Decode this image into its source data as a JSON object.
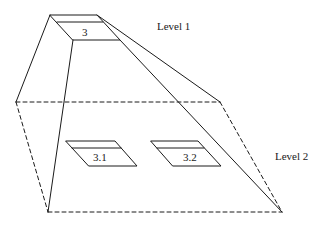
{
  "diagram": {
    "title": "",
    "colors": {
      "stroke": "#1a1a1a",
      "background": "#ffffff"
    },
    "levels": [
      {
        "id": "level-1",
        "label": "Level 1"
      },
      {
        "id": "level-2",
        "label": "Level 2"
      }
    ],
    "nodes": [
      {
        "id": "node-3",
        "label": "3",
        "level": 1
      },
      {
        "id": "node-3-1",
        "label": "3.1",
        "level": 2,
        "parent": "node-3"
      },
      {
        "id": "node-3-2",
        "label": "3.2",
        "level": 2,
        "parent": "node-3"
      }
    ],
    "edges": [
      {
        "from": "node-3",
        "to": "level-2-plane",
        "style": "solid",
        "description": "projection lines from node 3 down to level 2 plane"
      }
    ]
  }
}
